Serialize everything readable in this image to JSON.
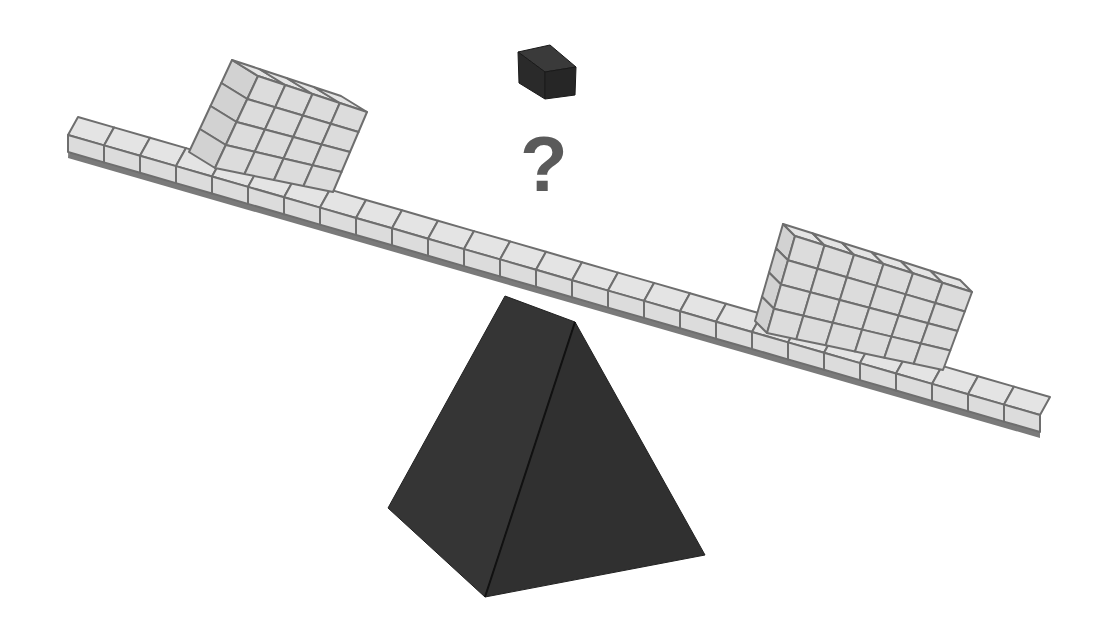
{
  "puzzle": {
    "question_mark": "?",
    "unknown_weight_label": "unknown cube count"
  },
  "beam": {
    "cell_count": 27,
    "front_top_left": [
      68,
      135
    ],
    "front_top_right": [
      1040,
      415
    ],
    "depth_vector": [
      10,
      -18
    ],
    "front_height": 17,
    "shadow_height": 6
  },
  "left_stack": {
    "columns": 4,
    "rows": 4,
    "front_top_left": [
      258,
      76
    ],
    "front_top_right": [
      367,
      112
    ],
    "front_bottom_left": [
      215,
      168
    ],
    "front_bottom_right": [
      333,
      192
    ],
    "back_top_left": [
      232,
      60
    ]
  },
  "right_stack": {
    "columns": 6,
    "rows": 4,
    "front_top_left": [
      795,
      236
    ],
    "front_top_right": [
      972,
      292
    ],
    "front_bottom_left": [
      767,
      333
    ],
    "front_bottom_right": [
      943,
      370
    ],
    "back_top_left": [
      783,
      224
    ]
  },
  "mystery_cube": {
    "color": "#2b2b2b"
  },
  "fulcrum": {
    "color": "#333333"
  },
  "colors": {
    "cell_fill": "#dcdcdc",
    "cell_top_fill": "#e4e4e4",
    "cell_stroke": "#6e6e6e",
    "shadow": "#7a7a7a",
    "dark": "#2f2f2f",
    "question": "#5a5a5a"
  }
}
